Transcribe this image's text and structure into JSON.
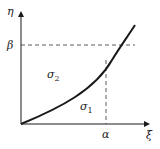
{
  "axes": {
    "y_label": "η",
    "x_label": "ξ"
  },
  "markers": {
    "beta": "β",
    "alpha": "α"
  },
  "regions": {
    "upper": "σ",
    "upper_sub": "2",
    "lower": "σ",
    "lower_sub": "1"
  },
  "colors": {
    "stroke": "#1a1a1a",
    "dashed": "#333333"
  }
}
